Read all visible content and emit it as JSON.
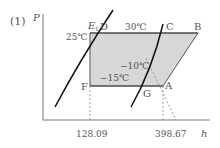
{
  "problem_number": "(1)",
  "axes": {
    "y_label": "P",
    "x_label": "h"
  },
  "points": {
    "D": "D",
    "C": "C",
    "B": "B",
    "F": "F",
    "G": "G",
    "A": "A",
    "E1": "E"
  },
  "e1_subscript": "1",
  "temperatures": {
    "t25": "25℃",
    "t30": "30℃",
    "tm10": "−10℃",
    "tm15": "−15℃"
  },
  "x_ticks": {
    "h_left": "128.09",
    "h_right": "398.67"
  },
  "colors": {
    "shade": "#d7d7d7",
    "line": "#444444",
    "curve": "#111111",
    "axis": "#666666",
    "dashed": "#777777"
  }
}
